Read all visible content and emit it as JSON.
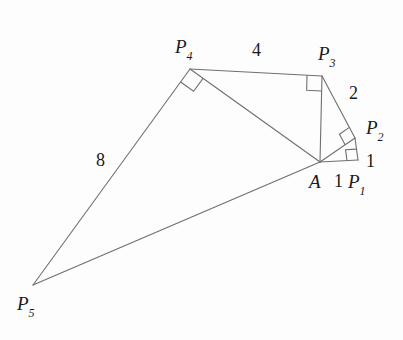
{
  "figure": {
    "stroke_color": "#6f6f6f",
    "background_color": "#fdfdfd",
    "text_color": "#1a1a1a",
    "stroke_width": 1.1,
    "vertices": [
      {
        "id": "A",
        "name": "A",
        "sub": "",
        "x": 320,
        "y": 162,
        "label_x": 309,
        "label_y": 172
      },
      {
        "id": "P1",
        "name": "P",
        "sub": "1",
        "x": 358,
        "y": 160,
        "label_x": 348,
        "label_y": 172
      },
      {
        "id": "P2",
        "name": "P",
        "sub": "2",
        "x": 355,
        "y": 138,
        "label_x": 366,
        "label_y": 118
      },
      {
        "id": "P3",
        "name": "P",
        "sub": "3",
        "x": 322,
        "y": 76,
        "label_x": 318,
        "label_y": 44
      },
      {
        "id": "P4",
        "name": "P",
        "sub": "4",
        "x": 190,
        "y": 69,
        "label_x": 175,
        "label_y": 37
      },
      {
        "id": "P5",
        "name": "P",
        "sub": "5",
        "x": 33,
        "y": 285,
        "label_x": 17,
        "label_y": 294
      }
    ],
    "edges": [
      {
        "from": "A",
        "to": "P1"
      },
      {
        "from": "P1",
        "to": "P2"
      },
      {
        "from": "A",
        "to": "P2"
      },
      {
        "from": "P2",
        "to": "P3"
      },
      {
        "from": "A",
        "to": "P3"
      },
      {
        "from": "P3",
        "to": "P4"
      },
      {
        "from": "A",
        "to": "P4"
      },
      {
        "from": "P4",
        "to": "P5"
      },
      {
        "from": "A",
        "to": "P5"
      }
    ],
    "edge_labels": [
      {
        "id": "len-a-p1",
        "text": "1",
        "x": 334,
        "y": 172
      },
      {
        "id": "len-p1-p2",
        "text": "1",
        "x": 366,
        "y": 152
      },
      {
        "id": "len-p2-p3",
        "text": "2",
        "x": 349,
        "y": 84
      },
      {
        "id": "len-p3-p4",
        "text": "4",
        "x": 252,
        "y": 41
      },
      {
        "id": "len-p4-p5",
        "text": "8",
        "x": 96,
        "y": 151
      }
    ],
    "right_angles": [
      {
        "id": "right-angle-p1",
        "at": "P1",
        "size": 11
      },
      {
        "id": "right-angle-p2",
        "at": "P2",
        "size": 12
      },
      {
        "id": "right-angle-p3",
        "at": "P3",
        "size": 15
      },
      {
        "id": "right-angle-p4",
        "at": "P4",
        "size": 16
      }
    ]
  }
}
